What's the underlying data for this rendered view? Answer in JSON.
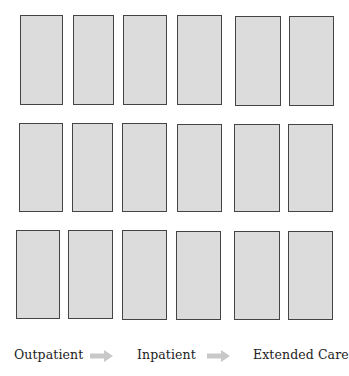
{
  "grid": {
    "rows": 3,
    "columns": 6,
    "fill_color": "#dcdcdc",
    "border_color": "#444444",
    "cards": [
      [
        {
          "x": 20,
          "y": 15,
          "w": 43,
          "h": 90
        },
        {
          "x": 73,
          "y": 15,
          "w": 41,
          "h": 90
        },
        {
          "x": 123,
          "y": 15,
          "w": 44,
          "h": 90
        },
        {
          "x": 177,
          "y": 15,
          "w": 45,
          "h": 90
        },
        {
          "x": 235,
          "y": 16,
          "w": 46,
          "h": 90
        },
        {
          "x": 289,
          "y": 16,
          "w": 45,
          "h": 90
        }
      ],
      [
        {
          "x": 19,
          "y": 123,
          "w": 44,
          "h": 89
        },
        {
          "x": 72,
          "y": 123,
          "w": 41,
          "h": 89
        },
        {
          "x": 122,
          "y": 123,
          "w": 45,
          "h": 89
        },
        {
          "x": 177,
          "y": 124,
          "w": 45,
          "h": 88
        },
        {
          "x": 234,
          "y": 124,
          "w": 46,
          "h": 88
        },
        {
          "x": 288,
          "y": 124,
          "w": 45,
          "h": 88
        }
      ],
      [
        {
          "x": 16,
          "y": 230,
          "w": 44,
          "h": 89
        },
        {
          "x": 68,
          "y": 230,
          "w": 45,
          "h": 89
        },
        {
          "x": 122,
          "y": 230,
          "w": 45,
          "h": 90
        },
        {
          "x": 176,
          "y": 231,
          "w": 45,
          "h": 89
        },
        {
          "x": 234,
          "y": 231,
          "w": 46,
          "h": 89
        },
        {
          "x": 288,
          "y": 231,
          "w": 45,
          "h": 89
        }
      ]
    ]
  },
  "flow": {
    "arrow_color": "#c8c8c8",
    "stages": [
      {
        "label": "Outpatient",
        "x": 14
      },
      {
        "label": "Inpatient",
        "x": 137
      },
      {
        "label": "Extended Care",
        "x": 253
      }
    ],
    "arrows": [
      {
        "name": "arrow-right-icon",
        "x": 90
      },
      {
        "name": "arrow-right-icon",
        "x": 207
      }
    ]
  }
}
